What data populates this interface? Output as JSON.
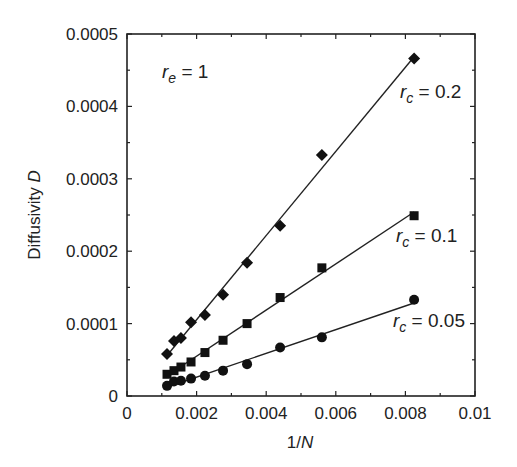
{
  "chart_data": {
    "type": "scatter",
    "title": "",
    "xlabel": "1/N",
    "ylabel": "Diffusivity D",
    "xlim": [
      0,
      0.01
    ],
    "ylim": [
      0,
      0.0005
    ],
    "x_ticks": [
      "0",
      "0.002",
      "0.004",
      "0.006",
      "0.008",
      "0.01"
    ],
    "y_ticks": [
      "0",
      "0.0001",
      "0.0002",
      "0.0003",
      "0.0004",
      "0.0005"
    ],
    "grid": false,
    "legend": "none (inline annotations)",
    "annotations": [
      {
        "text": "r_e = 1",
        "sub": "e",
        "value": "1",
        "position": "upper-left"
      },
      {
        "text": "r_c = 0.2",
        "sub": "c",
        "value": "0.2",
        "series": "r_c = 0.2"
      },
      {
        "text": "r_c = 0.1",
        "sub": "c",
        "value": "0.1",
        "series": "r_c = 0.1"
      },
      {
        "text": "r_c = 0.05",
        "sub": "c",
        "value": "0.05",
        "series": "r_c = 0.05"
      }
    ],
    "x": [
      0.00115,
      0.00135,
      0.00155,
      0.00184,
      0.00224,
      0.00276,
      0.00345,
      0.0044,
      0.0056,
      0.00825
    ],
    "series": [
      {
        "name": "r_c = 0.2",
        "marker": "diamond",
        "fit": "linear",
        "values": [
          5.8e-05,
          7.6e-05,
          8e-05,
          0.000102,
          0.000112,
          0.00014,
          0.000184,
          0.000235,
          0.000333,
          0.000466
        ]
      },
      {
        "name": "r_c = 0.1",
        "marker": "square",
        "fit": "linear",
        "values": [
          3e-05,
          3.5e-05,
          4e-05,
          4.7e-05,
          6e-05,
          7.7e-05,
          0.0001,
          0.000136,
          0.000177,
          0.000249
        ]
      },
      {
        "name": "r_c = 0.05",
        "marker": "circle",
        "fit": "linear",
        "values": [
          1.4e-05,
          2e-05,
          2.1e-05,
          2.4e-05,
          2.8e-05,
          3.5e-05,
          4.4e-05,
          6.7e-05,
          8.1e-05,
          0.000133
        ]
      }
    ]
  },
  "labels": {
    "xlabel_main": "1/",
    "xlabel_ital": "N",
    "ylabel_main": "Diffusivity ",
    "ylabel_ital": "D",
    "re_r": "r",
    "re_sub": "e",
    "re_val": " = 1",
    "rc_r": "r",
    "rc_sub": "c",
    "rc02_val": " = 0.2",
    "rc01_val": " = 0.1",
    "rc005_val": " = 0.05"
  }
}
